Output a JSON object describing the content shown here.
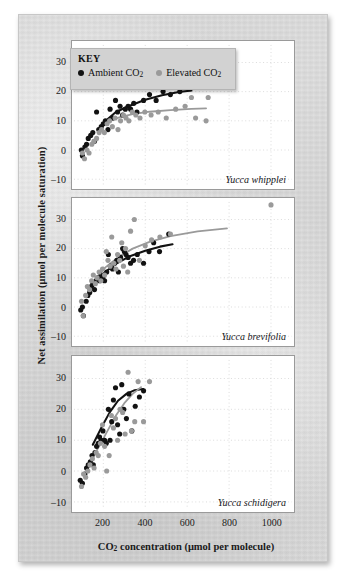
{
  "figure": {
    "x_axis_title": "CO2 concentration (μmol per molecule)",
    "y_axis_title": "Net assimilation (μmol per molecule saturation)"
  },
  "legend": {
    "title": "KEY",
    "entries": [
      {
        "label": "Ambient CO2",
        "marker": "filled-circle",
        "color": "#121212",
        "name": "ambient"
      },
      {
        "label": "Elevated CO2",
        "marker": "filled-circle",
        "color": "#9a9a9a",
        "name": "elevated"
      }
    ]
  },
  "axis": {
    "x_ticks": [
      200,
      400,
      600,
      800,
      1000
    ],
    "y_ticks": [
      -10,
      0,
      10,
      20,
      30
    ],
    "xlim": [
      60,
      1100
    ],
    "ylim": [
      -12,
      36
    ]
  },
  "chart_data": [
    {
      "type": "scatter",
      "panel_index": 0,
      "title": "Yucca whipplei",
      "xlabel": "CO2 concentration (μmol per molecule)",
      "ylabel": "Net assimilation (μmol per molecule saturation)",
      "xlim": [
        60,
        1100
      ],
      "ylim": [
        -12,
        36
      ],
      "grid": true,
      "legend_position": "top-left",
      "series": [
        {
          "name": "Ambient CO2",
          "color": "#121212",
          "points": [
            [
              95,
              0
            ],
            [
              100,
              -2
            ],
            [
              112,
              1
            ],
            [
              120,
              2
            ],
            [
              128,
              4
            ],
            [
              140,
              5
            ],
            [
              150,
              6
            ],
            [
              158,
              3
            ],
            [
              168,
              13
            ],
            [
              178,
              7
            ],
            [
              190,
              8
            ],
            [
              200,
              9
            ],
            [
              210,
              10
            ],
            [
              222,
              7
            ],
            [
              232,
              14
            ],
            [
              245,
              11
            ],
            [
              258,
              17
            ],
            [
              268,
              13
            ],
            [
              280,
              15
            ],
            [
              292,
              12
            ],
            [
              305,
              14
            ],
            [
              318,
              15
            ],
            [
              330,
              14
            ],
            [
              345,
              16
            ],
            [
              360,
              13
            ],
            [
              392,
              17
            ],
            [
              420,
              19
            ],
            [
              452,
              17
            ],
            [
              485,
              20
            ],
            [
              520,
              19
            ],
            [
              565,
              20
            ],
            [
              612,
              21
            ]
          ],
          "fit_curve": [
            [
              180,
              6.5
            ],
            [
              220,
              10.5
            ],
            [
              260,
              13.0
            ],
            [
              320,
              15.0
            ],
            [
              400,
              17.2
            ],
            [
              480,
              18.8
            ],
            [
              560,
              19.9
            ],
            [
              620,
              20.4
            ]
          ]
        },
        {
          "name": "Elevated CO2",
          "color": "#9a9a9a",
          "points": [
            [
              100,
              -1
            ],
            [
              110,
              -3
            ],
            [
              122,
              0
            ],
            [
              132,
              -1
            ],
            [
              145,
              2
            ],
            [
              155,
              3
            ],
            [
              168,
              4
            ],
            [
              180,
              6
            ],
            [
              192,
              7
            ],
            [
              205,
              6
            ],
            [
              218,
              9
            ],
            [
              230,
              10
            ],
            [
              243,
              8
            ],
            [
              256,
              11
            ],
            [
              270,
              7
            ],
            [
              282,
              10
            ],
            [
              296,
              12
            ],
            [
              308,
              11
            ],
            [
              322,
              10
            ],
            [
              338,
              13
            ],
            [
              355,
              12
            ],
            [
              375,
              11
            ],
            [
              398,
              13
            ],
            [
              428,
              12
            ],
            [
              462,
              13
            ],
            [
              500,
              11
            ],
            [
              545,
              14
            ],
            [
              590,
              15
            ],
            [
              640,
              11
            ],
            [
              690,
              10
            ],
            [
              620,
              18
            ],
            [
              700,
              18
            ]
          ],
          "fit_curve": [
            [
              190,
              8.0
            ],
            [
              230,
              10.0
            ],
            [
              280,
              11.3
            ],
            [
              340,
              12.3
            ],
            [
              420,
              13.1
            ],
            [
              520,
              13.7
            ],
            [
              620,
              14.1
            ],
            [
              690,
              14.3
            ]
          ]
        }
      ]
    },
    {
      "type": "scatter",
      "panel_index": 1,
      "title": "Yucca brevifolia",
      "xlabel": "CO2 concentration (μmol per molecule)",
      "ylabel": "Net assimilation (μmol per molecule saturation)",
      "xlim": [
        60,
        1100
      ],
      "ylim": [
        -12,
        36
      ],
      "grid": true,
      "series": [
        {
          "name": "Ambient CO2",
          "color": "#121212",
          "points": [
            [
              92,
              -1
            ],
            [
              100,
              0
            ],
            [
              105,
              -3
            ],
            [
              118,
              2
            ],
            [
              126,
              4
            ],
            [
              135,
              5
            ],
            [
              142,
              7
            ],
            [
              150,
              8
            ],
            [
              158,
              6
            ],
            [
              166,
              9
            ],
            [
              174,
              10
            ],
            [
              182,
              9
            ],
            [
              190,
              11
            ],
            [
              198,
              10
            ],
            [
              206,
              9
            ],
            [
              216,
              12
            ],
            [
              224,
              18
            ],
            [
              234,
              14
            ],
            [
              244,
              13
            ],
            [
              254,
              15
            ],
            [
              264,
              16
            ],
            [
              272,
              12
            ],
            [
              282,
              17
            ],
            [
              292,
              20
            ],
            [
              300,
              19
            ],
            [
              308,
              18
            ],
            [
              318,
              17
            ],
            [
              330,
              15
            ],
            [
              344,
              16
            ],
            [
              362,
              18
            ],
            [
              392,
              15
            ],
            [
              418,
              19
            ],
            [
              440,
              22
            ],
            [
              468,
              19
            ],
            [
              512,
              25
            ]
          ],
          "fit_curve": [
            [
              150,
              7.0
            ],
            [
              200,
              11.5
            ],
            [
              260,
              14.8
            ],
            [
              320,
              17.2
            ],
            [
              400,
              19.3
            ],
            [
              470,
              20.7
            ],
            [
              530,
              21.5
            ]
          ]
        },
        {
          "name": "Elevated CO2",
          "color": "#9a9a9a",
          "points": [
            [
              96,
              2
            ],
            [
              104,
              -3
            ],
            [
              116,
              4
            ],
            [
              124,
              7
            ],
            [
              134,
              6
            ],
            [
              144,
              9
            ],
            [
              152,
              11
            ],
            [
              162,
              8
            ],
            [
              170,
              10
            ],
            [
              180,
              12
            ],
            [
              188,
              9
            ],
            [
              196,
              13
            ],
            [
              206,
              11
            ],
            [
              214,
              19
            ],
            [
              222,
              16
            ],
            [
              232,
              14
            ],
            [
              240,
              24
            ],
            [
              250,
              15
            ],
            [
              260,
              13
            ],
            [
              268,
              18
            ],
            [
              278,
              16
            ],
            [
              288,
              22
            ],
            [
              296,
              14
            ],
            [
              306,
              20
            ],
            [
              316,
              12
            ],
            [
              330,
              26
            ],
            [
              348,
              30
            ],
            [
              372,
              16
            ],
            [
              400,
              21
            ],
            [
              430,
              23
            ],
            [
              470,
              24
            ],
            [
              520,
              25
            ],
            [
              1000,
              35
            ]
          ],
          "fit_curve": [
            [
              160,
              9.5
            ],
            [
              210,
              13.6
            ],
            [
              270,
              17.0
            ],
            [
              340,
              20.0
            ],
            [
              420,
              22.3
            ],
            [
              520,
              24.3
            ],
            [
              650,
              25.9
            ],
            [
              790,
              26.9
            ]
          ]
        }
      ]
    },
    {
      "type": "scatter",
      "panel_index": 2,
      "title": "Yucca schidigera",
      "xlabel": "CO2 concentration (μmol per molecule)",
      "ylabel": "Net assimilation (μmol per molecule saturation)",
      "xlim": [
        60,
        1100
      ],
      "ylim": [
        -12,
        36
      ],
      "grid": true,
      "series": [
        {
          "name": "Ambient CO2",
          "color": "#121212",
          "points": [
            [
              90,
              -3
            ],
            [
              100,
              -4
            ],
            [
              112,
              -1
            ],
            [
              120,
              1
            ],
            [
              128,
              2
            ],
            [
              138,
              3
            ],
            [
              146,
              5
            ],
            [
              152,
              2
            ],
            [
              160,
              6
            ],
            [
              168,
              8
            ],
            [
              176,
              9
            ],
            [
              182,
              11
            ],
            [
              190,
              10
            ],
            [
              198,
              13
            ],
            [
              206,
              10
            ],
            [
              214,
              9
            ],
            [
              224,
              20
            ],
            [
              232,
              10
            ],
            [
              240,
              16
            ],
            [
              248,
              23
            ],
            [
              258,
              27
            ],
            [
              268,
              15
            ],
            [
              278,
              12
            ],
            [
              288,
              28
            ],
            [
              298,
              20
            ],
            [
              310,
              17
            ],
            [
              322,
              25
            ],
            [
              336,
              13
            ],
            [
              352,
              21
            ],
            [
              372,
              24
            ],
            [
              392,
              26
            ]
          ],
          "fit_curve": [
            [
              150,
              8.5
            ],
            [
              190,
              14.0
            ],
            [
              230,
              19.0
            ],
            [
              270,
              22.8
            ],
            [
              310,
              25.0
            ],
            [
              350,
              26.2
            ],
            [
              390,
              26.6
            ]
          ]
        },
        {
          "name": "Elevated CO2",
          "color": "#9a9a9a",
          "points": [
            [
              96,
              -5
            ],
            [
              106,
              -1
            ],
            [
              116,
              -2
            ],
            [
              126,
              0
            ],
            [
              136,
              2
            ],
            [
              148,
              4
            ],
            [
              156,
              1
            ],
            [
              166,
              6
            ],
            [
              176,
              5
            ],
            [
              186,
              9
            ],
            [
              196,
              15
            ],
            [
              206,
              8
            ],
            [
              216,
              0
            ],
            [
              228,
              5
            ],
            [
              238,
              18
            ],
            [
              248,
              14
            ],
            [
              258,
              17
            ],
            [
              268,
              10
            ],
            [
              280,
              20
            ],
            [
              292,
              19
            ],
            [
              304,
              12
            ],
            [
              318,
              32
            ],
            [
              334,
              13
            ],
            [
              350,
              16
            ],
            [
              366,
              29
            ],
            [
              392,
              16
            ],
            [
              420,
              29
            ]
          ],
          "fit_curve": [
            [
              140,
              3.5
            ],
            [
              180,
              8.0
            ],
            [
              220,
              13.0
            ],
            [
              260,
              18.0
            ],
            [
              300,
              22.0
            ],
            [
              340,
              25.0
            ],
            [
              380,
              27.2
            ]
          ]
        }
      ]
    }
  ]
}
